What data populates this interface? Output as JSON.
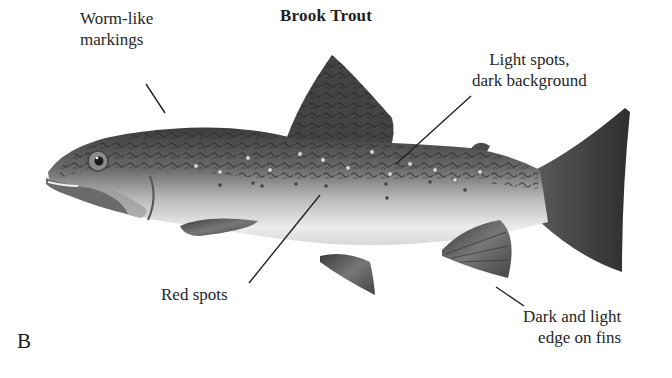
{
  "figure": {
    "title": "Brook Trout",
    "panel_letter": "B"
  },
  "labels": [
    {
      "id": "worm",
      "lines": [
        "Worm-like",
        "markings"
      ],
      "points_to": "back / dorsal surface"
    },
    {
      "id": "light",
      "lines": [
        "Light spots,",
        "dark background"
      ],
      "points_to": "upper flank"
    },
    {
      "id": "red",
      "lines": [
        "Red spots"
      ],
      "points_to": "mid flank"
    },
    {
      "id": "edge",
      "lines": [
        "Dark and light",
        "edge on fins"
      ],
      "points_to": "anal fin"
    }
  ],
  "colors": {
    "background": "#ffffff",
    "text": "#262626",
    "leader_line": "#222222",
    "fish_dark": "#3a3a3a",
    "fish_mid": "#8a8a8a",
    "fish_light": "#e8e8e8"
  }
}
